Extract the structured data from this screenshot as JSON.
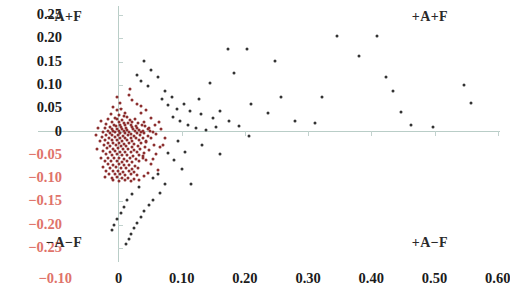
{
  "chart_data": {
    "type": "scatter",
    "title": "",
    "xlabel": "",
    "ylabel": "",
    "xlim": [
      -0.115,
      0.615
    ],
    "ylim": [
      -0.265,
      0.265
    ],
    "grid": false,
    "legend": null,
    "x_ticks": [
      -0.1,
      0,
      0.1,
      0.2,
      0.3,
      0.4,
      0.5,
      0.6
    ],
    "x_tick_labels": [
      "−0.10",
      "0",
      "0.10",
      "0.20",
      "0.30",
      "0.40",
      "0.50",
      "0.60"
    ],
    "y_ticks": [
      0.25,
      0.2,
      0.15,
      0.1,
      0.05,
      0,
      -0.05,
      -0.1,
      -0.15,
      -0.2,
      -0.25
    ],
    "y_tick_labels": [
      "0.25",
      "0.20",
      "0.15",
      "0.10",
      "0.05",
      "0",
      "−0.05",
      "−0.10",
      "−0.15",
      "−0.20",
      "−0.25"
    ],
    "annotations": [
      {
        "id": "quad-tl",
        "text": "−A+F",
        "x": -0.085,
        "y": 0.245
      },
      {
        "id": "quad-tr",
        "text": "+A+F",
        "x": 0.525,
        "y": 0.245
      },
      {
        "id": "quad-bl",
        "text": "−A−F",
        "x": -0.085,
        "y": -0.215
      },
      {
        "id": "quad-br",
        "text": "+A−F",
        "x": 0.525,
        "y": -0.215
      }
    ],
    "series": [
      {
        "name": "cluster",
        "color": "#8c2f2f",
        "points": [
          [
            -0.008,
            0.052
          ],
          [
            -0.003,
            0.046
          ],
          [
            0.004,
            0.049
          ],
          [
            -0.012,
            0.038
          ],
          [
            0.001,
            0.036
          ],
          [
            0.009,
            0.034
          ],
          [
            -0.006,
            0.03
          ],
          [
            0.014,
            0.031
          ],
          [
            -0.016,
            0.026
          ],
          [
            -0.002,
            0.027
          ],
          [
            0.006,
            0.025
          ],
          [
            0.018,
            0.024
          ],
          [
            0.026,
            0.027
          ],
          [
            -0.01,
            0.021
          ],
          [
            0.0,
            0.02
          ],
          [
            0.008,
            0.019
          ],
          [
            0.015,
            0.018
          ],
          [
            0.022,
            0.021
          ],
          [
            0.031,
            0.018
          ],
          [
            -0.019,
            0.016
          ],
          [
            -0.007,
            0.015
          ],
          [
            0.002,
            0.014
          ],
          [
            0.011,
            0.013
          ],
          [
            0.019,
            0.015
          ],
          [
            0.028,
            0.012
          ],
          [
            0.037,
            0.014
          ],
          [
            -0.014,
            0.01
          ],
          [
            -0.004,
            0.011
          ],
          [
            0.004,
            0.009
          ],
          [
            0.012,
            0.008
          ],
          [
            0.021,
            0.01
          ],
          [
            0.03,
            0.008
          ],
          [
            0.042,
            0.011
          ],
          [
            -0.021,
            0.007
          ],
          [
            -0.011,
            0.006
          ],
          [
            -0.002,
            0.005
          ],
          [
            0.006,
            0.006
          ],
          [
            0.014,
            0.004
          ],
          [
            0.023,
            0.005
          ],
          [
            0.033,
            0.004
          ],
          [
            0.046,
            0.006
          ],
          [
            -0.017,
            0.002
          ],
          [
            -0.008,
            0.002
          ],
          [
            0.0,
            0.001
          ],
          [
            0.009,
            0.002
          ],
          [
            0.017,
            0.0
          ],
          [
            0.026,
            0.001
          ],
          [
            0.036,
            0.0
          ],
          [
            0.05,
            0.002
          ],
          [
            -0.024,
            -0.002
          ],
          [
            -0.013,
            -0.003
          ],
          [
            -0.005,
            -0.002
          ],
          [
            0.003,
            -0.004
          ],
          [
            0.011,
            -0.003
          ],
          [
            0.02,
            -0.005
          ],
          [
            0.029,
            -0.003
          ],
          [
            0.04,
            -0.004
          ],
          [
            0.054,
            -0.002
          ],
          [
            -0.019,
            -0.007
          ],
          [
            -0.01,
            -0.008
          ],
          [
            -0.001,
            -0.007
          ],
          [
            0.007,
            -0.009
          ],
          [
            0.015,
            -0.008
          ],
          [
            0.024,
            -0.01
          ],
          [
            0.034,
            -0.008
          ],
          [
            0.047,
            -0.009
          ],
          [
            -0.026,
            -0.012
          ],
          [
            -0.015,
            -0.013
          ],
          [
            -0.006,
            -0.012
          ],
          [
            0.002,
            -0.014
          ],
          [
            0.01,
            -0.013
          ],
          [
            0.019,
            -0.015
          ],
          [
            0.028,
            -0.013
          ],
          [
            0.039,
            -0.015
          ],
          [
            -0.021,
            -0.018
          ],
          [
            -0.011,
            -0.019
          ],
          [
            -0.003,
            -0.018
          ],
          [
            0.005,
            -0.02
          ],
          [
            0.013,
            -0.019
          ],
          [
            0.022,
            -0.021
          ],
          [
            0.032,
            -0.019
          ],
          [
            0.044,
            -0.021
          ],
          [
            -0.017,
            -0.024
          ],
          [
            -0.008,
            -0.025
          ],
          [
            0.0,
            -0.024
          ],
          [
            0.008,
            -0.026
          ],
          [
            0.016,
            -0.025
          ],
          [
            0.025,
            -0.027
          ],
          [
            0.036,
            -0.025
          ],
          [
            -0.023,
            -0.03
          ],
          [
            -0.013,
            -0.031
          ],
          [
            -0.004,
            -0.03
          ],
          [
            0.004,
            -0.032
          ],
          [
            0.012,
            -0.031
          ],
          [
            0.021,
            -0.033
          ],
          [
            0.031,
            -0.031
          ],
          [
            0.042,
            -0.033
          ],
          [
            -0.018,
            -0.036
          ],
          [
            -0.009,
            -0.037
          ],
          [
            -0.001,
            -0.036
          ],
          [
            0.007,
            -0.038
          ],
          [
            0.015,
            -0.037
          ],
          [
            0.024,
            -0.039
          ],
          [
            0.034,
            -0.037
          ],
          [
            -0.025,
            -0.042
          ],
          [
            -0.014,
            -0.043
          ],
          [
            -0.005,
            -0.042
          ],
          [
            0.003,
            -0.044
          ],
          [
            0.011,
            -0.043
          ],
          [
            0.02,
            -0.045
          ],
          [
            0.03,
            -0.043
          ],
          [
            0.041,
            -0.046
          ],
          [
            -0.02,
            -0.049
          ],
          [
            -0.01,
            -0.05
          ],
          [
            -0.002,
            -0.049
          ],
          [
            0.006,
            -0.051
          ],
          [
            0.014,
            -0.05
          ],
          [
            0.023,
            -0.052
          ],
          [
            0.033,
            -0.05
          ],
          [
            -0.016,
            -0.056
          ],
          [
            -0.007,
            -0.057
          ],
          [
            0.001,
            -0.056
          ],
          [
            0.009,
            -0.058
          ],
          [
            0.018,
            -0.057
          ],
          [
            0.027,
            -0.059
          ],
          [
            0.038,
            -0.057
          ],
          [
            -0.022,
            -0.063
          ],
          [
            -0.012,
            -0.064
          ],
          [
            -0.003,
            -0.063
          ],
          [
            0.005,
            -0.065
          ],
          [
            0.013,
            -0.064
          ],
          [
            0.022,
            -0.066
          ],
          [
            0.032,
            -0.064
          ],
          [
            -0.017,
            -0.07
          ],
          [
            -0.008,
            -0.071
          ],
          [
            0.0,
            -0.07
          ],
          [
            0.008,
            -0.072
          ],
          [
            0.017,
            -0.071
          ],
          [
            0.026,
            -0.073
          ],
          [
            -0.024,
            -0.077
          ],
          [
            -0.013,
            -0.078
          ],
          [
            -0.004,
            -0.077
          ],
          [
            0.004,
            -0.079
          ],
          [
            0.012,
            -0.078
          ],
          [
            0.021,
            -0.08
          ],
          [
            0.031,
            -0.078
          ],
          [
            -0.019,
            -0.084
          ],
          [
            -0.009,
            -0.085
          ],
          [
            -0.001,
            -0.084
          ],
          [
            0.007,
            -0.086
          ],
          [
            0.016,
            -0.085
          ],
          [
            0.025,
            -0.087
          ],
          [
            -0.015,
            -0.091
          ],
          [
            -0.006,
            -0.092
          ],
          [
            0.002,
            -0.091
          ],
          [
            0.011,
            -0.093
          ],
          [
            0.019,
            -0.092
          ],
          [
            0.029,
            -0.094
          ],
          [
            -0.021,
            -0.098
          ],
          [
            -0.011,
            -0.099
          ],
          [
            -0.002,
            -0.098
          ],
          [
            0.006,
            -0.1
          ],
          [
            0.015,
            -0.099
          ],
          [
            0.024,
            -0.101
          ],
          [
            -0.008,
            -0.105
          ],
          [
            0.001,
            -0.106
          ],
          [
            0.01,
            -0.105
          ],
          [
            0.019,
            -0.107
          ],
          [
            0.033,
            -0.104
          ],
          [
            0.04,
            -0.096
          ],
          [
            0.046,
            -0.088
          ],
          [
            0.052,
            -0.07
          ],
          [
            0.044,
            -0.062
          ],
          [
            0.038,
            -0.052
          ],
          [
            0.049,
            -0.04
          ],
          [
            0.056,
            -0.03
          ],
          [
            0.043,
            -0.022
          ],
          [
            0.051,
            -0.014
          ],
          [
            0.06,
            -0.006
          ],
          [
            0.039,
            0.002
          ],
          [
            0.048,
            0.008
          ],
          [
            0.057,
            0.014
          ],
          [
            0.041,
            0.02
          ],
          [
            0.052,
            0.028
          ],
          [
            0.064,
            0.02
          ],
          [
            0.035,
            0.04
          ],
          [
            0.044,
            0.046
          ],
          [
            0.029,
            0.058
          ],
          [
            0.022,
            0.068
          ],
          [
            0.016,
            0.078
          ],
          [
            0.018,
            0.092
          ],
          [
            0.01,
            0.04
          ],
          [
            0.003,
            0.062
          ],
          [
            -0.003,
            0.074
          ],
          [
            0.036,
            0.055
          ],
          [
            0.068,
            0.006
          ],
          [
            0.073,
            -0.014
          ],
          [
            0.066,
            -0.034
          ],
          [
            0.06,
            -0.048
          ],
          [
            0.055,
            -0.058
          ],
          [
            0.062,
            -0.082
          ],
          [
            0.07,
            -0.028
          ],
          [
            -0.03,
            -0.02
          ],
          [
            -0.034,
            -0.038
          ],
          [
            -0.028,
            -0.056
          ],
          [
            -0.036,
            -0.008
          ],
          [
            -0.032,
            0.008
          ],
          [
            -0.027,
            0.022
          ]
        ]
      },
      {
        "name": "outliers",
        "color": "#333333",
        "points": [
          [
            0.041,
            0.152
          ],
          [
            0.052,
            0.133
          ],
          [
            0.062,
            0.118
          ],
          [
            0.036,
            0.108
          ],
          [
            0.03,
            0.122
          ],
          [
            0.046,
            0.097
          ],
          [
            0.073,
            0.086
          ],
          [
            0.069,
            0.07
          ],
          [
            0.085,
            0.073
          ],
          [
            0.078,
            0.056
          ],
          [
            0.093,
            0.049
          ],
          [
            0.104,
            0.06
          ],
          [
            0.113,
            0.044
          ],
          [
            0.13,
            0.038
          ],
          [
            0.086,
            0.031
          ],
          [
            0.097,
            0.022
          ],
          [
            0.11,
            0.014
          ],
          [
            0.123,
            0.008
          ],
          [
            0.139,
            0.004
          ],
          [
            0.155,
            0.01
          ],
          [
            0.149,
            0.03
          ],
          [
            0.16,
            0.044
          ],
          [
            0.175,
            0.022
          ],
          [
            0.191,
            0.012
          ],
          [
            0.128,
            0.07
          ],
          [
            0.145,
            0.104
          ],
          [
            0.174,
            0.178
          ],
          [
            0.203,
            0.178
          ],
          [
            0.183,
            0.126
          ],
          [
            0.21,
            0.06
          ],
          [
            0.247,
            0.152
          ],
          [
            0.257,
            0.075
          ],
          [
            0.236,
            0.04
          ],
          [
            0.279,
            0.023
          ],
          [
            0.311,
            0.018
          ],
          [
            0.322,
            0.073
          ],
          [
            0.345,
            0.205
          ],
          [
            0.38,
            0.163
          ],
          [
            0.409,
            0.204
          ],
          [
            0.423,
            0.118
          ],
          [
            0.435,
            0.086
          ],
          [
            0.447,
            0.041
          ],
          [
            0.463,
            0.013
          ],
          [
            0.497,
            0.01
          ],
          [
            0.546,
            0.1
          ],
          [
            0.558,
            0.062
          ],
          [
            0.206,
            -0.01
          ],
          [
            0.161,
            -0.048
          ],
          [
            0.132,
            -0.028
          ],
          [
            0.101,
            -0.08
          ],
          [
            0.115,
            -0.112
          ],
          [
            0.088,
            -0.062
          ],
          [
            0.074,
            -0.112
          ],
          [
            0.066,
            -0.131
          ],
          [
            0.054,
            -0.146
          ],
          [
            0.048,
            -0.158
          ],
          [
            0.041,
            -0.17
          ],
          [
            0.036,
            -0.184
          ],
          [
            0.029,
            -0.196
          ],
          [
            0.025,
            -0.208
          ],
          [
            0.02,
            -0.219
          ],
          [
            0.016,
            -0.23
          ],
          [
            0.012,
            -0.241
          ],
          [
            0.032,
            -0.12
          ],
          [
            0.022,
            -0.134
          ],
          [
            0.014,
            -0.148
          ],
          [
            0.009,
            -0.162
          ],
          [
            0.004,
            -0.175
          ],
          [
            -0.002,
            -0.188
          ],
          [
            -0.007,
            -0.2
          ],
          [
            -0.011,
            -0.212
          ],
          [
            0.054,
            -0.1
          ],
          [
            0.063,
            -0.092
          ],
          [
            0.078,
            -0.046
          ],
          [
            0.094,
            -0.02
          ],
          [
            0.106,
            -0.044
          ]
        ]
      }
    ]
  }
}
